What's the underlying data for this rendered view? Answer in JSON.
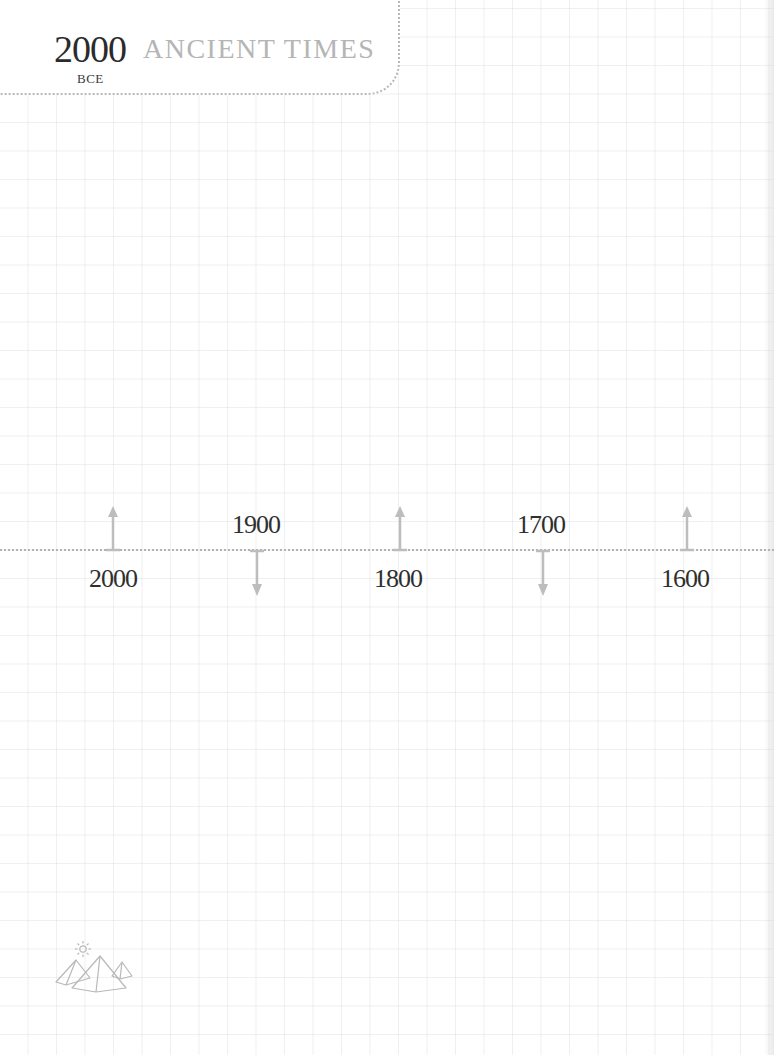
{
  "header": {
    "year": "2000",
    "era": "BCE",
    "title": "ANCIENT TIMES"
  },
  "timeline": {
    "markers": [
      {
        "label": "2000",
        "direction": "up",
        "label_position": "below",
        "x": 113
      },
      {
        "label": "1900",
        "direction": "down",
        "label_position": "above",
        "x": 256
      },
      {
        "label": "1800",
        "direction": "up",
        "label_position": "below",
        "x": 399
      },
      {
        "label": "1700",
        "direction": "down",
        "label_position": "above",
        "x": 542
      },
      {
        "label": "1600",
        "direction": "up",
        "label_position": "below",
        "x": 686
      }
    ]
  },
  "decoration": {
    "icon": "pyramids-with-sun-icon"
  },
  "colors": {
    "background": "#ffffff",
    "grid": "#ececec",
    "dotted_line": "#b3b3b3",
    "arrow": "#b9b9b9",
    "year_text": "#2b2b2b",
    "title_text": "#b5b5b5"
  }
}
